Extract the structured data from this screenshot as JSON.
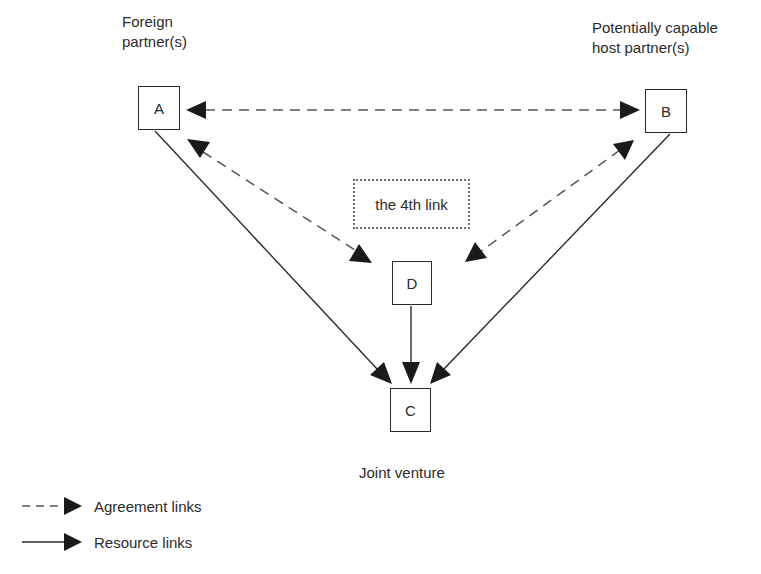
{
  "diagram": {
    "labels": {
      "foreign_partner": [
        "Foreign",
        "partner(s)"
      ],
      "host_partner": [
        "Potentially capable",
        "host partner(s)"
      ],
      "joint_venture": "Joint venture",
      "fourth_link": "the 4th link"
    },
    "nodes": [
      {
        "id": "A",
        "label": "A",
        "role": "Foreign partner(s)"
      },
      {
        "id": "B",
        "label": "B",
        "role": "Potentially capable host partner(s)"
      },
      {
        "id": "C",
        "label": "C",
        "role": "Joint venture"
      },
      {
        "id": "D",
        "label": "D",
        "role": "the 4th link"
      }
    ],
    "edges": [
      {
        "from": "A",
        "to": "B",
        "type": "agreement",
        "bidirectional": true
      },
      {
        "from": "A",
        "to": "D",
        "type": "agreement",
        "bidirectional": true
      },
      {
        "from": "B",
        "to": "D",
        "type": "agreement",
        "bidirectional": true
      },
      {
        "from": "A",
        "to": "C",
        "type": "resource",
        "bidirectional": false
      },
      {
        "from": "B",
        "to": "C",
        "type": "resource",
        "bidirectional": false
      },
      {
        "from": "D",
        "to": "C",
        "type": "resource",
        "bidirectional": false
      }
    ],
    "legend": [
      {
        "style": "dashed",
        "label": "Agreement links"
      },
      {
        "style": "solid",
        "label": "Resource links"
      }
    ],
    "colors": {
      "stroke": "#2b2b2b",
      "dash": "#555555",
      "dotted_border": "#6b6b6b"
    }
  }
}
